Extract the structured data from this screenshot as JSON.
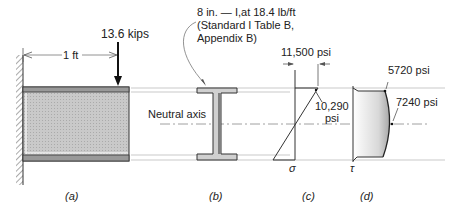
{
  "figure": {
    "panel_a": {
      "caption": "(a)",
      "load_label": "13.6 kips",
      "span_label": "1 ft"
    },
    "panel_b": {
      "caption": "(b)",
      "section_note_line1": "8 in. — I,at 18.4 lb/ft",
      "section_note_line2": "(Standard I Table B,",
      "section_note_line3": "Appendix B)",
      "neutral_axis_label": "Neutral axis"
    },
    "panel_c": {
      "caption": "(c)",
      "symbol": "σ",
      "max_stress_label": "11,500 psi",
      "flange_stress_line1": "10,290",
      "flange_stress_line2": "psi"
    },
    "panel_d": {
      "caption": "(d)",
      "symbol": "τ",
      "flange_shear_label": "5720 psi",
      "max_shear_label": "7240 psi"
    }
  }
}
